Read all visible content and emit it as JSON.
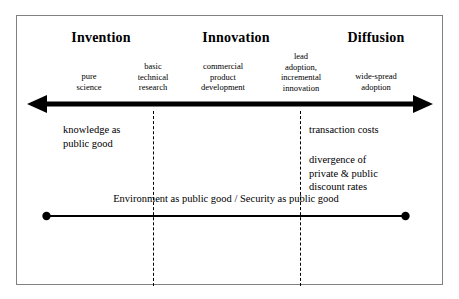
{
  "diagram": {
    "colors": {
      "ink": "#000000",
      "frame": "#808080",
      "background": "#ffffff"
    },
    "phases": [
      {
        "label": "Invention",
        "center_x": 100
      },
      {
        "label": "Innovation",
        "center_x": 235
      },
      {
        "label": "Diffusion",
        "center_x": 375
      }
    ],
    "stages": [
      {
        "label": "pure\nscience",
        "center_x": 88,
        "top": 70
      },
      {
        "label": "basic\ntechnical\nresearch",
        "center_x": 152,
        "top": 60
      },
      {
        "label": "commercial\nproduct\ndevelopment",
        "center_x": 222,
        "top": 60
      },
      {
        "label": "lead\nadoption,\nincremental\ninnovation",
        "center_x": 300,
        "top": 50
      },
      {
        "label": "wide-spread\nadoption",
        "center_x": 375,
        "top": 70
      }
    ],
    "dividers": [
      {
        "x": 152,
        "top": 110,
        "height": 175
      },
      {
        "x": 299,
        "top": 110,
        "height": 175
      }
    ],
    "arrow": {
      "name": "double-headed-arrow",
      "direction": "both",
      "shaft_thickness": 5
    },
    "notes": [
      {
        "text": "knowledge as\npublic good",
        "left": 62,
        "top": 122
      },
      {
        "text": "transaction costs",
        "left": 308,
        "top": 122
      },
      {
        "text": "divergence of\nprivate & public\ndiscount rates",
        "left": 308,
        "top": 152
      }
    ],
    "bottom_bar": {
      "label": "Environment as public good / Security as public good",
      "endpoint_marker": "filled-circle"
    }
  }
}
